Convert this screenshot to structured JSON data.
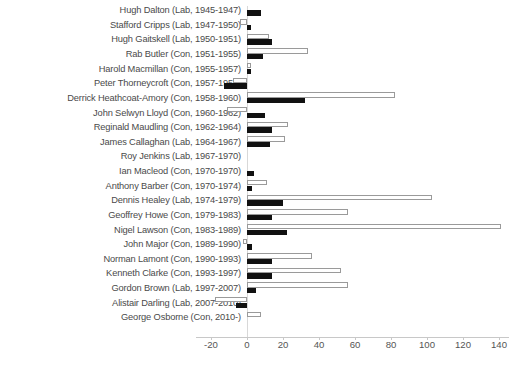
{
  "chart_data": {
    "type": "bar",
    "title": "",
    "subtitle": "",
    "xlabel": "",
    "ylabel": "",
    "orientation": "horizontal",
    "grid": false,
    "legend_position": "none",
    "xlim": [
      -25,
      147
    ],
    "xticks": [
      -20,
      0,
      20,
      40,
      60,
      80,
      100,
      120,
      140
    ],
    "xtick_labels": [
      "-20",
      "0",
      "20",
      "40",
      "60",
      "80",
      "100",
      "120",
      "140"
    ],
    "zero_reference": 0,
    "categories": [
      "Hugh Dalton (Lab, 1945-1947)",
      "Stafford Cripps (Lab, 1947-1950)",
      "Hugh Gaitskell (Lab, 1950-1951)",
      "Rab Butler (Con, 1951-1955)",
      "Harold Macmillan (Con, 1955-1957)",
      "Peter Thorneycroft (Con, 1957-1958)",
      "Derrick Heathcoat-Amory (Con, 1958-1960)",
      "John Selwyn Lloyd (Con, 1960-1962)",
      "Reginald Maudling (Con, 1962-1964)",
      "James Callaghan (Lab, 1964-1967)",
      "Roy Jenkins (Lab, 1967-1970)",
      "Ian Macleod (Con, 1970-1970)",
      "Anthony Barber (Con, 1970-1974)",
      "Dennis Healey (Lab, 1974-1979)",
      "Geoffrey Howe (Con, 1979-1983)",
      "Nigel Lawson (Con, 1983-1989)",
      "John Major (Con, 1989-1990)",
      "Norman Lamont (Con, 1990-1993)",
      "Kenneth Clarke (Con, 1993-1997)",
      "Gordon Brown  (Lab, 1997-2007)",
      "Alistair Darling (Lab, 2007-2010)",
      "George Osborne (Con, 2010-)"
    ],
    "series": [
      {
        "name": "white-series",
        "style": "open",
        "values": [
          0,
          -4,
          12,
          34,
          2,
          -8,
          82,
          -11,
          23,
          21,
          0,
          0,
          11,
          103,
          56,
          141,
          -2,
          36,
          52,
          56,
          -18,
          8
        ]
      },
      {
        "name": "black-series",
        "style": "filled",
        "values": [
          8,
          2,
          14,
          9,
          2,
          -13,
          32,
          10,
          14,
          13,
          0,
          4,
          3,
          20,
          14,
          22,
          3,
          14,
          14,
          5,
          -6,
          0
        ]
      }
    ]
  },
  "footnote": {
    "text": ""
  }
}
